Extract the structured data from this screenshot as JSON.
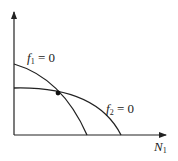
{
  "diagram": {
    "type": "phase-plane-nullclines",
    "curves": [
      {
        "name": "f1",
        "label_var": "f",
        "label_sub": "1",
        "label_rest": " = 0"
      },
      {
        "name": "f2",
        "label_var": "f",
        "label_sub": "2",
        "label_rest": " = 0"
      }
    ],
    "x_axis": {
      "var": "N",
      "sub": "1"
    },
    "equilibrium_point": true,
    "colors": {
      "stroke": "#222222",
      "background": "#ffffff"
    }
  }
}
